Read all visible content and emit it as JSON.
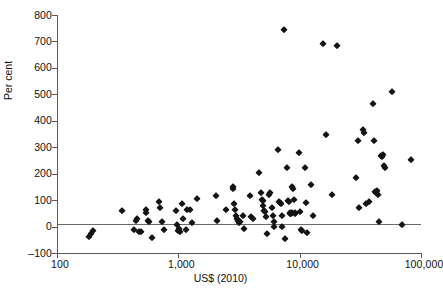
{
  "chart_data": {
    "type": "scatter",
    "title": "",
    "xlabel": "US$ (2010)",
    "ylabel": "Per cent",
    "xscale": "log",
    "yscale": "linear",
    "xlim": [
      100,
      100000
    ],
    "ylim": [
      -100,
      800
    ],
    "xticks": [
      100,
      1000,
      10000,
      100000
    ],
    "xticklabels": [
      "100",
      "1,000",
      "10,000",
      "100,000"
    ],
    "yticks": [
      -100,
      0,
      100,
      200,
      300,
      400,
      500,
      600,
      700,
      800
    ],
    "yticklabels": [
      "-100",
      "0",
      "100",
      "200",
      "300",
      "400",
      "500",
      "600",
      "700",
      "800"
    ],
    "grid": false,
    "legend": null,
    "reference_lines": [
      {
        "axis": "y",
        "value": 0,
        "label": ""
      }
    ],
    "marker": "diamond",
    "marker_color": "#141414",
    "points": [
      {
        "x": 185,
        "y": -38
      },
      {
        "x": 190,
        "y": -30
      },
      {
        "x": 198,
        "y": -16
      },
      {
        "x": 345,
        "y": 60
      },
      {
        "x": 430,
        "y": -12
      },
      {
        "x": 450,
        "y": 22
      },
      {
        "x": 455,
        "y": 30
      },
      {
        "x": 470,
        "y": -22
      },
      {
        "x": 490,
        "y": -20
      },
      {
        "x": 540,
        "y": 64
      },
      {
        "x": 545,
        "y": 52
      },
      {
        "x": 560,
        "y": 22
      },
      {
        "x": 575,
        "y": 16
      },
      {
        "x": 610,
        "y": -42
      },
      {
        "x": 690,
        "y": 91
      },
      {
        "x": 700,
        "y": 72
      },
      {
        "x": 740,
        "y": 18
      },
      {
        "x": 760,
        "y": -12
      },
      {
        "x": 960,
        "y": 60
      },
      {
        "x": 980,
        "y": 4
      },
      {
        "x": 1000,
        "y": -18
      },
      {
        "x": 1010,
        "y": -8
      },
      {
        "x": 1030,
        "y": -22
      },
      {
        "x": 1080,
        "y": 86
      },
      {
        "x": 1100,
        "y": 30
      },
      {
        "x": 1150,
        "y": -14
      },
      {
        "x": 1180,
        "y": 62
      },
      {
        "x": 1250,
        "y": 63
      },
      {
        "x": 1300,
        "y": 12
      },
      {
        "x": 1420,
        "y": 106
      },
      {
        "x": 2050,
        "y": 117
      },
      {
        "x": 2100,
        "y": 22
      },
      {
        "x": 2450,
        "y": 62
      },
      {
        "x": 2800,
        "y": 150
      },
      {
        "x": 2820,
        "y": 143
      },
      {
        "x": 2900,
        "y": 87
      },
      {
        "x": 2950,
        "y": 62
      },
      {
        "x": 3000,
        "y": 40
      },
      {
        "x": 3050,
        "y": 30
      },
      {
        "x": 3100,
        "y": 20
      },
      {
        "x": 3150,
        "y": 14
      },
      {
        "x": 3200,
        "y": 16
      },
      {
        "x": 3400,
        "y": 40
      },
      {
        "x": 3500,
        "y": -10
      },
      {
        "x": 3900,
        "y": 114
      },
      {
        "x": 4000,
        "y": 36
      },
      {
        "x": 4100,
        "y": 30
      },
      {
        "x": 4600,
        "y": 204
      },
      {
        "x": 4800,
        "y": 128
      },
      {
        "x": 4900,
        "y": 100
      },
      {
        "x": 4950,
        "y": 96
      },
      {
        "x": 5000,
        "y": 78
      },
      {
        "x": 5100,
        "y": 60
      },
      {
        "x": 5150,
        "y": 56
      },
      {
        "x": 5300,
        "y": 35
      },
      {
        "x": 5400,
        "y": -30
      },
      {
        "x": 5600,
        "y": 118
      },
      {
        "x": 5700,
        "y": 126
      },
      {
        "x": 5900,
        "y": 70
      },
      {
        "x": 6000,
        "y": 40
      },
      {
        "x": 6100,
        "y": 18
      },
      {
        "x": 6200,
        "y": 0
      },
      {
        "x": 6600,
        "y": 288
      },
      {
        "x": 6800,
        "y": 92
      },
      {
        "x": 6900,
        "y": 88
      },
      {
        "x": 7000,
        "y": 86
      },
      {
        "x": 7100,
        "y": 40
      },
      {
        "x": 7200,
        "y": -2
      },
      {
        "x": 7400,
        "y": 742
      },
      {
        "x": 7500,
        "y": -48
      },
      {
        "x": 7900,
        "y": 222
      },
      {
        "x": 8000,
        "y": 97
      },
      {
        "x": 8100,
        "y": 94
      },
      {
        "x": 8300,
        "y": 52
      },
      {
        "x": 8400,
        "y": 48
      },
      {
        "x": 8500,
        "y": 46
      },
      {
        "x": 8600,
        "y": 50
      },
      {
        "x": 8700,
        "y": 150
      },
      {
        "x": 8800,
        "y": 142
      },
      {
        "x": 9000,
        "y": 100
      },
      {
        "x": 9100,
        "y": 52
      },
      {
        "x": 9200,
        "y": 48
      },
      {
        "x": 9800,
        "y": 278
      },
      {
        "x": 10000,
        "y": 54
      },
      {
        "x": 10200,
        "y": -12
      },
      {
        "x": 10400,
        "y": -16
      },
      {
        "x": 11000,
        "y": 220
      },
      {
        "x": 11200,
        "y": 88
      },
      {
        "x": 11500,
        "y": -24
      },
      {
        "x": 12500,
        "y": 158
      },
      {
        "x": 13000,
        "y": 40
      },
      {
        "x": 15500,
        "y": 690
      },
      {
        "x": 16500,
        "y": 348
      },
      {
        "x": 18500,
        "y": 118
      },
      {
        "x": 20500,
        "y": 683
      },
      {
        "x": 29000,
        "y": 184
      },
      {
        "x": 30000,
        "y": 322
      },
      {
        "x": 31000,
        "y": 72
      },
      {
        "x": 33000,
        "y": 364
      },
      {
        "x": 34000,
        "y": 352
      },
      {
        "x": 35000,
        "y": 86
      },
      {
        "x": 37000,
        "y": 94
      },
      {
        "x": 40000,
        "y": 462
      },
      {
        "x": 41000,
        "y": 322
      },
      {
        "x": 42000,
        "y": 130
      },
      {
        "x": 42500,
        "y": 126
      },
      {
        "x": 43000,
        "y": 134
      },
      {
        "x": 44000,
        "y": 118
      },
      {
        "x": 45000,
        "y": 16
      },
      {
        "x": 47000,
        "y": 268
      },
      {
        "x": 48000,
        "y": 264
      },
      {
        "x": 49000,
        "y": 270
      },
      {
        "x": 50000,
        "y": 228
      },
      {
        "x": 50500,
        "y": 222
      },
      {
        "x": 58000,
        "y": 508
      },
      {
        "x": 70000,
        "y": 6
      },
      {
        "x": 82000,
        "y": 250
      }
    ]
  }
}
